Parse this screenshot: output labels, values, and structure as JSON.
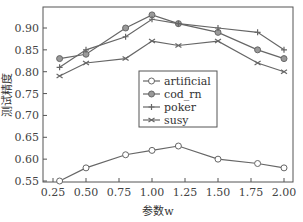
{
  "chart_data": {
    "type": "line",
    "title": "",
    "xlabel": "参数w",
    "ylabel": "测试精度",
    "xlim": [
      0.25,
      2.0
    ],
    "ylim": [
      0.53,
      0.95
    ],
    "xticks": [
      "0.25",
      "0.50",
      "0.75",
      "1.00",
      "1.25",
      "1.50",
      "1.75",
      "2.00"
    ],
    "yticks": [
      "0.55",
      "0.60",
      "0.65",
      "0.70",
      "0.75",
      "0.80",
      "0.85",
      "0.90"
    ],
    "x": [
      0.3,
      0.5,
      0.8,
      1.0,
      1.2,
      1.5,
      1.8,
      2.0
    ],
    "grid": false,
    "legend_position": "center",
    "series": [
      {
        "name": "artificial",
        "marker": "diamond-open",
        "values": [
          0.55,
          0.58,
          0.61,
          0.62,
          0.63,
          0.6,
          0.59,
          0.58
        ]
      },
      {
        "name": "cod_rn",
        "marker": "circle",
        "values": [
          0.83,
          0.84,
          0.9,
          0.93,
          0.91,
          0.89,
          0.85,
          0.83
        ]
      },
      {
        "name": "poker",
        "marker": "plus",
        "values": [
          0.81,
          0.85,
          0.88,
          0.92,
          0.91,
          0.9,
          0.89,
          0.85
        ]
      },
      {
        "name": "susy",
        "marker": "x",
        "values": [
          0.79,
          0.82,
          0.83,
          0.87,
          0.86,
          0.87,
          0.82,
          0.8
        ]
      }
    ]
  },
  "colors": {
    "line": "#666666",
    "axis": "#555555"
  }
}
